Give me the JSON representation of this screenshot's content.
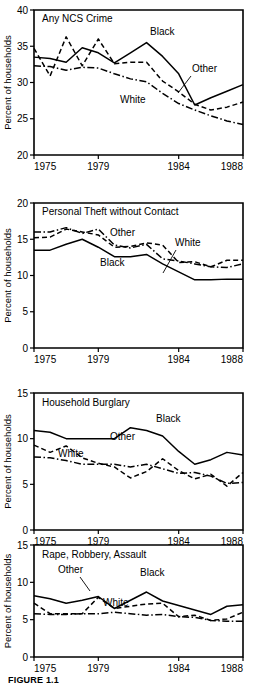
{
  "figure": {
    "caption": "FIGURE 1.1",
    "axis_title": "Percent of households",
    "xlabel": "",
    "x_ticks": [
      "1975",
      "1979",
      "1984",
      "1988"
    ],
    "x_tick_values": [
      1975,
      1979,
      1984,
      1988
    ],
    "series_names": [
      "Black",
      "Other",
      "White"
    ]
  },
  "chart_data": [
    {
      "type": "line",
      "title": "Any NCS Crime",
      "xlabel": "",
      "ylabel": "Percent of households",
      "xlim": [
        1975,
        1988
      ],
      "ylim": [
        20,
        40
      ],
      "y_ticks": [
        20,
        25,
        30,
        35,
        40
      ],
      "x_ticks": [
        1975,
        1979,
        1984,
        1988
      ],
      "grid": false,
      "legend": "inline-annotations",
      "x": [
        1975,
        1976,
        1977,
        1978,
        1979,
        1980,
        1981,
        1982,
        1983,
        1984,
        1985,
        1986,
        1987,
        1988
      ],
      "series": [
        {
          "name": "Black",
          "style": "solid",
          "values": [
            33.5,
            33.3,
            32.8,
            34.8,
            34.1,
            32.7,
            34.1,
            35.5,
            33.6,
            31.2,
            26.9,
            27.9,
            28.8,
            29.7
          ]
        },
        {
          "name": "Other",
          "style": "dashed",
          "values": [
            34.7,
            30.9,
            36.3,
            32.3,
            36.0,
            32.6,
            32.8,
            32.8,
            30.2,
            28.7,
            27.0,
            26.2,
            26.6,
            27.3
          ]
        },
        {
          "name": "White",
          "style": "dash-dot",
          "values": [
            32.3,
            32.2,
            31.7,
            32.1,
            32.0,
            31.2,
            30.5,
            30.1,
            28.5,
            27.1,
            26.2,
            25.4,
            24.7,
            24.2
          ]
        }
      ],
      "annotations": [
        {
          "text": "Black",
          "near_x": 1982,
          "near_y": 35.5
        },
        {
          "text": "Other",
          "near_x": 1986,
          "near_y": 26.2
        },
        {
          "text": "White",
          "near_x": 1982,
          "near_y": 29.0
        }
      ]
    },
    {
      "type": "line",
      "title": "Personal Theft without Contact",
      "xlabel": "",
      "ylabel": "Percent of households",
      "xlim": [
        1975,
        1988
      ],
      "ylim": [
        0,
        20
      ],
      "y_ticks": [
        0,
        5,
        10,
        15,
        20
      ],
      "x_ticks": [
        1975,
        1979,
        1984,
        1988
      ],
      "grid": false,
      "legend": "inline-annotations",
      "x": [
        1975,
        1976,
        1977,
        1978,
        1979,
        1980,
        1981,
        1982,
        1983,
        1984,
        1985,
        1986,
        1987,
        1988
      ],
      "series": [
        {
          "name": "Black",
          "style": "solid",
          "values": [
            13.5,
            13.5,
            14.3,
            15.0,
            13.9,
            12.6,
            12.6,
            12.9,
            11.6,
            10.5,
            9.4,
            9.4,
            9.5,
            9.5
          ]
        },
        {
          "name": "Other",
          "style": "dashed",
          "values": [
            15.2,
            15.3,
            16.4,
            16.0,
            15.6,
            13.9,
            14.0,
            14.5,
            14.2,
            11.8,
            11.9,
            11.2,
            12.1,
            12.1
          ]
        },
        {
          "name": "White",
          "style": "dash-dot",
          "values": [
            16.0,
            16.0,
            16.6,
            15.8,
            16.4,
            14.2,
            13.8,
            14.3,
            12.3,
            12.0,
            11.6,
            11.2,
            11.1,
            11.6
          ]
        }
      ],
      "annotations": [
        {
          "text": "Other",
          "near_x": 1979,
          "near_y": 16.0
        },
        {
          "text": "White",
          "near_x": 1984,
          "near_y": 14.5
        },
        {
          "text": "Black",
          "near_x": 1979,
          "near_y": 12.0
        }
      ]
    },
    {
      "type": "line",
      "title": "Household Burglary",
      "xlabel": "",
      "ylabel": "Percent of households",
      "xlim": [
        1975,
        1988
      ],
      "ylim": [
        0,
        15
      ],
      "y_ticks": [
        0,
        5,
        10,
        15
      ],
      "x_ticks": [
        1975,
        1979,
        1984,
        1988
      ],
      "grid": false,
      "legend": "inline-annotations",
      "x": [
        1975,
        1976,
        1977,
        1978,
        1979,
        1980,
        1981,
        1982,
        1983,
        1984,
        1985,
        1986,
        1987,
        1988
      ],
      "series": [
        {
          "name": "Black",
          "style": "solid",
          "values": [
            10.9,
            10.7,
            10.0,
            10.0,
            10.0,
            10.0,
            11.2,
            10.9,
            10.3,
            8.6,
            7.2,
            7.7,
            8.5,
            8.2
          ]
        },
        {
          "name": "Other",
          "style": "dashed",
          "values": [
            9.3,
            8.5,
            9.2,
            7.9,
            7.3,
            6.9,
            5.7,
            6.4,
            7.8,
            6.5,
            5.6,
            6.1,
            4.8,
            6.3
          ]
        },
        {
          "name": "White",
          "style": "dash-dot",
          "values": [
            8.0,
            7.9,
            7.6,
            7.2,
            7.2,
            7.2,
            6.9,
            7.2,
            6.7,
            6.2,
            6.3,
            5.9,
            5.1,
            5.2
          ]
        }
      ],
      "annotations": [
        {
          "text": "Black",
          "near_x": 1982,
          "near_y": 10.9
        },
        {
          "text": "Other",
          "near_x": 1979,
          "near_y": 7.3
        },
        {
          "text": "White",
          "near_x": 1977,
          "near_y": 6.0
        }
      ]
    },
    {
      "type": "line",
      "title": "Rape, Robbery, Assault",
      "xlabel": "",
      "ylabel": "Percent of households",
      "xlim": [
        1975,
        1988
      ],
      "ylim": [
        0,
        15
      ],
      "y_ticks": [
        0,
        5,
        10,
        15
      ],
      "x_ticks": [
        1975,
        1979,
        1984,
        1988
      ],
      "grid": false,
      "legend": "inline-annotations",
      "x": [
        1975,
        1976,
        1977,
        1978,
        1979,
        1980,
        1981,
        1982,
        1983,
        1984,
        1985,
        1986,
        1987,
        1988
      ],
      "series": [
        {
          "name": "Black",
          "style": "solid",
          "values": [
            8.2,
            7.8,
            7.2,
            7.6,
            8.1,
            6.5,
            7.6,
            8.7,
            7.5,
            6.9,
            6.3,
            5.7,
            6.8,
            7.0
          ]
        },
        {
          "name": "Other",
          "style": "dashed",
          "values": [
            7.2,
            5.8,
            5.8,
            5.8,
            8.0,
            6.5,
            6.8,
            7.1,
            7.2,
            5.4,
            5.6,
            4.9,
            5.1,
            6.0
          ]
        },
        {
          "name": "White",
          "style": "dash-dot",
          "values": [
            5.8,
            5.7,
            5.7,
            5.8,
            5.8,
            6.0,
            5.8,
            5.6,
            5.7,
            5.4,
            5.3,
            4.9,
            4.8,
            4.8
          ]
        }
      ],
      "annotations": [
        {
          "text": "Other",
          "near_x": 1977,
          "near_y": 9.3
        },
        {
          "text": "Black",
          "near_x": 1982,
          "near_y": 9.0
        },
        {
          "text": "White",
          "near_x": 1981,
          "near_y": 4.4
        }
      ]
    }
  ]
}
